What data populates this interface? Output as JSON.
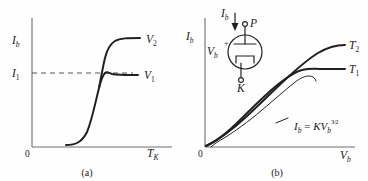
{
  "figure": {
    "background_color": "#fefefe",
    "ink_color": "#231f20",
    "axis_color": "#6d6d6d"
  },
  "panel_a": {
    "caption": "(a)",
    "origin_label": "0",
    "y_axis": {
      "symbol": "I",
      "subscript": "b"
    },
    "x_axis": {
      "symbol": "T",
      "subscript": "K"
    },
    "y_tick": {
      "symbol": "I",
      "subscript": "1"
    },
    "curves": [
      {
        "name": "upper-saturation-curve",
        "symbol": "V",
        "subscript": "2"
      },
      {
        "name": "lower-saturation-curve",
        "symbol": "V",
        "subscript": "1"
      }
    ],
    "dashed_guide": "horizontal guide at I1 level"
  },
  "panel_b": {
    "caption": "(b)",
    "origin_label": "0",
    "y_axis": {
      "symbol": "I",
      "subscript": "b"
    },
    "x_axis": {
      "symbol": "V",
      "subscript": "b"
    },
    "curves": [
      {
        "name": "upper-temperature-curve",
        "symbol": "T",
        "subscript": "2"
      },
      {
        "name": "lower-temperature-curve",
        "symbol": "T",
        "subscript": "1"
      }
    ],
    "equation": {
      "lhs_symbol": "I",
      "lhs_subscript": "b",
      "equals": "=",
      "constant": "K",
      "var_symbol": "V",
      "var_subscript": "b",
      "exponent_numerator": "3",
      "exponent_slash": "⁄",
      "exponent_denominator": "2",
      "plain_text": "Ib = K Vb^(3/2)"
    },
    "tube_diagram": {
      "name": "vacuum-diode-tube",
      "current_label": {
        "symbol": "I",
        "subscript": "b"
      },
      "plate_terminal": "P",
      "cathode_terminal": "K",
      "voltage_label": {
        "symbol": "V",
        "subscript": "b"
      },
      "polarity_sign": "+"
    }
  }
}
